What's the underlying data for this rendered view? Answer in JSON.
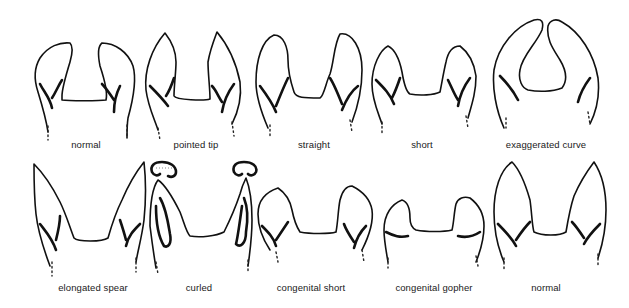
{
  "diagram": {
    "type": "illustration",
    "rows": [
      {
        "items": [
          {
            "label": "normal",
            "x": 86,
            "y": 139
          },
          {
            "label": "pointed tip",
            "x": 196,
            "y": 139
          },
          {
            "label": "straight",
            "x": 314,
            "y": 139
          },
          {
            "label": "short",
            "x": 422,
            "y": 139
          },
          {
            "label": "exaggerated curve",
            "x": 546,
            "y": 139
          }
        ]
      },
      {
        "items": [
          {
            "label": "elongated spear",
            "x": 93,
            "y": 282
          },
          {
            "label": "curled",
            "x": 199,
            "y": 282
          },
          {
            "label": "congenital short",
            "x": 311,
            "y": 282
          },
          {
            "label": "congenital gopher",
            "x": 434,
            "y": 282
          },
          {
            "label": "normal",
            "x": 546,
            "y": 282
          }
        ]
      }
    ]
  },
  "colors": {
    "ink": "#111111",
    "background": "#ffffff"
  }
}
